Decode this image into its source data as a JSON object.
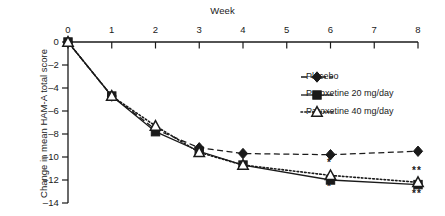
{
  "chart_data": {
    "type": "line",
    "title": "",
    "xlabel": "Week",
    "ylabel": "Change in mean HAM-A total score",
    "x": [
      0,
      1,
      2,
      3,
      4,
      6,
      8
    ],
    "xticks": [
      "0",
      "1",
      "2",
      "3",
      "4",
      "5",
      "6",
      "7",
      "8"
    ],
    "xtickvalues": [
      0,
      1,
      2,
      3,
      4,
      5,
      6,
      7,
      8
    ],
    "yticks": [
      "0",
      "–2",
      "–4",
      "–6",
      "–8",
      "–10",
      "–12",
      "–14"
    ],
    "ytickvalues": [
      0,
      -2,
      -4,
      -6,
      -8,
      -10,
      -12,
      -14
    ],
    "xlim": [
      0,
      8
    ],
    "ylim": [
      -14,
      0
    ],
    "grid": false,
    "legend_position": "upper right",
    "series": [
      {
        "name": "Placebo",
        "marker": "filled-diamond",
        "line": "dashed",
        "values": [
          0,
          -4.7,
          -7.6,
          -9.2,
          -9.7,
          -9.8,
          -9.5
        ]
      },
      {
        "name": "Paroxetine 20 mg/day",
        "marker": "filled-square",
        "line": "solid",
        "values": [
          0,
          -4.7,
          -7.8,
          -9.5,
          -10.7,
          -12.0,
          -12.4
        ]
      },
      {
        "name": "Paroxetine 40 mg/day",
        "marker": "open-triangle",
        "line": "dotted",
        "values": [
          0,
          -4.7,
          -7.3,
          -9.6,
          -10.7,
          -11.6,
          -12.2
        ]
      }
    ],
    "annotations": [
      {
        "text": "*",
        "series": "Paroxetine 40 mg/day",
        "x": 6,
        "y": -10.6,
        "placement": "above"
      },
      {
        "text": "*",
        "series": "Paroxetine 20 mg/day",
        "x": 6,
        "y": -12.7,
        "placement": "below"
      },
      {
        "text": "**",
        "series": "Paroxetine 40 mg/day",
        "x": 8,
        "y": -11.3,
        "placement": "above"
      },
      {
        "text": "**",
        "series": "Paroxetine 20 mg/day",
        "x": 8,
        "y": -13.3,
        "placement": "below"
      }
    ],
    "colors": {
      "axis": "#1a1a1a",
      "series": "#1a1a1a",
      "background": "#ffffff"
    }
  }
}
